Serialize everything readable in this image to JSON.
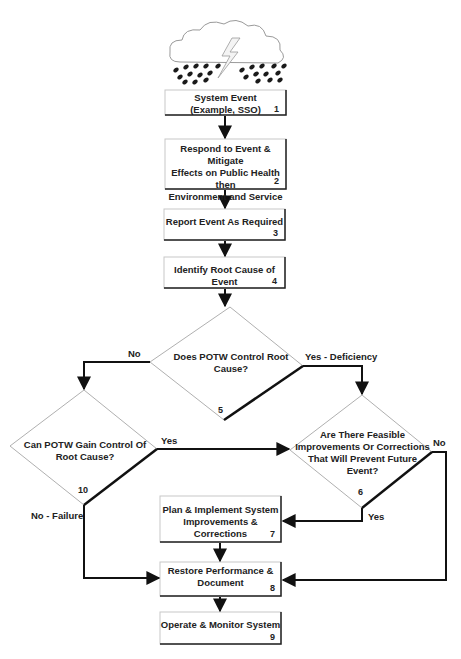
{
  "diagram": {
    "type": "flowchart",
    "header_icon": "storm-cloud-icon",
    "nodes": [
      {
        "id": "1",
        "shape": "process",
        "label_line1": "System Event",
        "label_line2": "(Example, SSO)",
        "number": "1"
      },
      {
        "id": "2",
        "shape": "process",
        "label_line1": "Respond to Event & Mitigate",
        "label_line2": "Effects on Public Health then",
        "label_line3": "Environment and Service",
        "number": "2"
      },
      {
        "id": "3",
        "shape": "process",
        "label_line1": "Report Event As Required",
        "number": "3"
      },
      {
        "id": "4",
        "shape": "process",
        "label_line1": "Identify Root Cause of Event",
        "number": "4"
      },
      {
        "id": "5",
        "shape": "decision",
        "label_line1": "Does POTW Control Root",
        "label_line2": "Cause?",
        "number": "5"
      },
      {
        "id": "10",
        "shape": "decision",
        "label_line1": "Can POTW Gain Control Of",
        "label_line2": "Root Cause?",
        "number": "10"
      },
      {
        "id": "6",
        "shape": "decision",
        "label_line1": "Are There Feasible",
        "label_line2": "Improvements Or Corrections",
        "label_line3": "That Will Prevent Future",
        "label_line4": "Event?",
        "number": "6"
      },
      {
        "id": "7",
        "shape": "process",
        "label_line1": "Plan & Implement System",
        "label_line2": "Improvements & Corrections",
        "number": "7"
      },
      {
        "id": "8",
        "shape": "process",
        "label_line1": "Restore Performance &",
        "label_line2": "Document",
        "number": "8"
      },
      {
        "id": "9",
        "shape": "process",
        "label_line1": "Operate & Monitor System",
        "number": "9"
      }
    ],
    "edges": [
      {
        "from": "1",
        "to": "2",
        "label": ""
      },
      {
        "from": "2",
        "to": "3",
        "label": ""
      },
      {
        "from": "3",
        "to": "4",
        "label": ""
      },
      {
        "from": "4",
        "to": "5",
        "label": ""
      },
      {
        "from": "5",
        "to": "10",
        "label": "No"
      },
      {
        "from": "5",
        "to": "6",
        "label": "Yes - Deficiency"
      },
      {
        "from": "10",
        "to": "6",
        "label": "Yes"
      },
      {
        "from": "10",
        "to": "8",
        "label": "No - Failure"
      },
      {
        "from": "6",
        "to": "7",
        "label": "Yes"
      },
      {
        "from": "6",
        "to": "8",
        "label": "No"
      },
      {
        "from": "7",
        "to": "8",
        "label": ""
      },
      {
        "from": "8",
        "to": "9",
        "label": ""
      }
    ],
    "colors": {
      "line": "#111111",
      "diamond_border": "#b0b0b0",
      "box_border": "#c8c8c8",
      "box_shadow": "#222222",
      "cloud": "#9a9a9a",
      "rain": "#1a1a1a"
    }
  }
}
